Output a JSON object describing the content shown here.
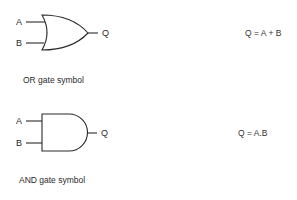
{
  "gates": [
    {
      "type": "OR",
      "inputs": [
        "A",
        "B"
      ],
      "output": "Q",
      "caption": "OR gate symbol",
      "equation": "Q = A + B"
    },
    {
      "type": "AND",
      "inputs": [
        "A",
        "B"
      ],
      "output": "Q",
      "caption": "AND gate symbol",
      "equation": "Q = A.B"
    }
  ],
  "colors": {
    "stroke": "#2a2a2a",
    "background": "#ffffff"
  }
}
